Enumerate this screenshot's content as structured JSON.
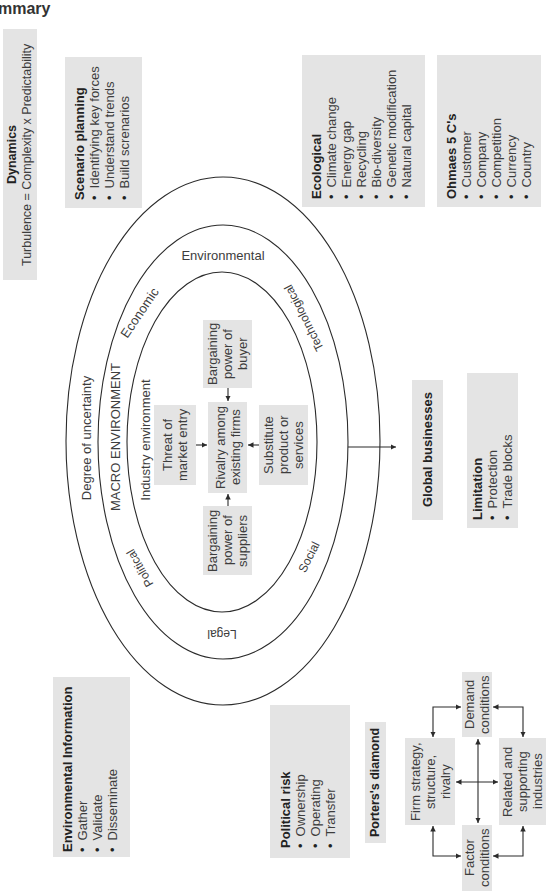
{
  "page": {
    "heading": "mmary"
  },
  "symbols": {
    "bullet": "•"
  },
  "colors": {
    "box_fill": "#e4e4e4",
    "text": "#3d3d3d",
    "title": "#222222",
    "line": "#2b2b2b"
  },
  "dynamics": {
    "title": "Dynamics",
    "text": "Turbulence = Complexity x Predictability"
  },
  "scenario_planning": {
    "title": "Scenario planning",
    "items": [
      "Identifying key forces",
      "Understand trends",
      "Build screnarios"
    ]
  },
  "ecological": {
    "title": "Ecological",
    "items": [
      "Climate change",
      "Energy gap",
      "Recycling",
      "Bio-diversity",
      "Genetic modification",
      "Natural capital"
    ]
  },
  "ohmaes": {
    "title": "Ohmaes 5 C's",
    "items": [
      "Customer",
      "Company",
      "Competition",
      "Currency",
      "Country"
    ]
  },
  "rings": {
    "outer_label": "Degree of uncertainty",
    "macro_label": "MACRO ENVIRONMENT",
    "industry_label": "Industry environment",
    "pestle": {
      "economic": "Economic",
      "environmental": "Environmental",
      "technological": "Technological",
      "political": "Political",
      "social": "Social",
      "legal": "Legal"
    }
  },
  "five_forces": {
    "threat": [
      "Threat of",
      "market entry"
    ],
    "rivalry": [
      "Rivalry among",
      "existing firms"
    ],
    "buyer": [
      "Bargaining",
      "power of",
      "buyer"
    ],
    "suppliers": [
      "Bargaining",
      "power of",
      "suppliers"
    ],
    "substitute": [
      "Substitute",
      "product or",
      "services"
    ]
  },
  "global_businesses": {
    "label": "Global businesses"
  },
  "limitation": {
    "title": "Limitation",
    "items": [
      "Protection",
      "Trade blocks"
    ]
  },
  "environmental_information": {
    "title": "Environmental Information",
    "items": [
      "Gather",
      "Validate",
      "Disseminate"
    ]
  },
  "political_risk": {
    "title": "Political risk",
    "items": [
      "Ownership",
      "Operating",
      "Transfer"
    ]
  },
  "porters_diamond": {
    "title": "Porters's diamond",
    "demand": [
      "Demand",
      "conditions"
    ],
    "firm": [
      "Firm strategy,",
      "structure,",
      "rivalry"
    ],
    "related": [
      "Related and",
      "supporting",
      "industries"
    ],
    "factor": [
      "Factor",
      "conditions"
    ]
  }
}
